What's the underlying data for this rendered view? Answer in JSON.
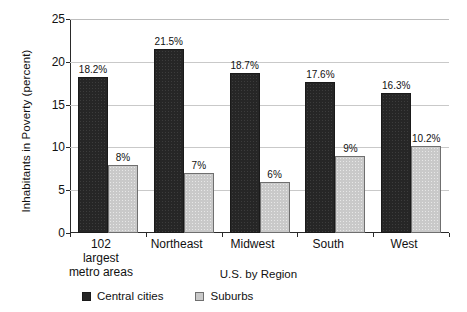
{
  "chart_data": {
    "type": "bar",
    "title": "",
    "xlabel": "U.S. by Region",
    "ylabel": "Inhabitants in Poverty (percent)",
    "ylim": [
      0,
      25
    ],
    "yticks": [
      0,
      5,
      10,
      15,
      20,
      25
    ],
    "ytick_labels": [
      "0",
      "5",
      "10",
      "15",
      "20",
      "25"
    ],
    "grid": true,
    "legend_position": "bottom-left",
    "categories": [
      "102 largest metro areas",
      "Northeast",
      "Midwest",
      "South",
      "West"
    ],
    "category_lines": [
      [
        "102",
        "largest",
        "metro areas"
      ],
      [
        "Northeast"
      ],
      [
        "Midwest"
      ],
      [
        "South"
      ],
      [
        "West"
      ]
    ],
    "series": [
      {
        "name": "Central cities",
        "color": "#262626",
        "values": [
          18.2,
          21.5,
          18.7,
          17.6,
          16.3
        ],
        "labels": [
          "18.2%",
          "21.5%",
          "18.7%",
          "17.6%",
          "16.3%"
        ]
      },
      {
        "name": "Suburbs",
        "color": "#c9c9c9",
        "values": [
          8,
          7,
          6,
          9,
          10.2
        ],
        "labels": [
          "8%",
          "7%",
          "6%",
          "9%",
          "10.2%"
        ]
      }
    ]
  },
  "legend": {
    "items": [
      {
        "label": "Central cities",
        "swatch": "dark"
      },
      {
        "label": "Suburbs",
        "swatch": "light"
      }
    ]
  }
}
